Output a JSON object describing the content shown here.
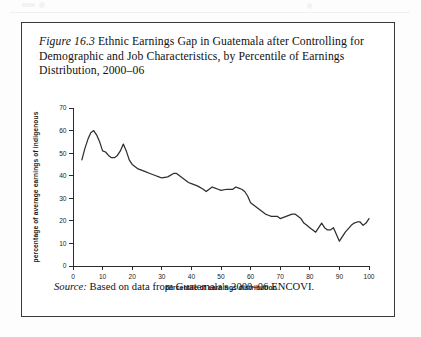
{
  "figure": {
    "label": "Figure 16.3",
    "title_rest": " Ethnic Earnings Gap in Guatemala after Controlling for Demographic and Job Characteristics, by Percentile of Earnings Distribution, 2000–06",
    "source_label": "Source:",
    "source_text": " Based on data from Guatemala's 2000–06 ENCOVI."
  },
  "chart_data": {
    "type": "line",
    "title": "",
    "xlabel": "percentile of earnings distribution",
    "ylabel": "percentage of average earnings of indigenous",
    "xlim": [
      0,
      100
    ],
    "ylim": [
      0,
      70
    ],
    "xticks": [
      0,
      10,
      20,
      30,
      40,
      50,
      60,
      70,
      80,
      90,
      100
    ],
    "yticks": [
      0,
      10,
      20,
      30,
      40,
      50,
      60,
      70
    ],
    "xtick_labels": [
      "0",
      "10",
      "20",
      "30",
      "40",
      "50",
      "60",
      "70",
      "80",
      "90",
      "100"
    ],
    "ytick_labels": [
      "0",
      "10",
      "20",
      "30",
      "40",
      "50",
      "60",
      "70"
    ],
    "grid": false,
    "legend": false,
    "line_color": "#2e2e2e",
    "series": [
      {
        "name": "ethnic earnings gap",
        "x": [
          3,
          4,
          5,
          6,
          7,
          8,
          9,
          10,
          11,
          12,
          13,
          14,
          15,
          16,
          17,
          18,
          19,
          20,
          22,
          24,
          26,
          28,
          29,
          30,
          32,
          34,
          35,
          36,
          37,
          38,
          39,
          40,
          42,
          44,
          45,
          46,
          47,
          48,
          49,
          50,
          52,
          54,
          55,
          56,
          57,
          58,
          59,
          60,
          62,
          64,
          65,
          66,
          67,
          68,
          69,
          70,
          72,
          74,
          75,
          76,
          77,
          78,
          79,
          80,
          81,
          82,
          83,
          84,
          85,
          86,
          87,
          88,
          89,
          90,
          92,
          94,
          95,
          96,
          97,
          98,
          99,
          100
        ],
        "y": [
          47,
          52,
          56,
          59,
          60,
          58,
          55,
          51,
          50.5,
          49,
          48,
          48,
          49,
          51,
          54,
          51,
          47,
          45,
          43,
          42,
          41,
          40,
          39.5,
          39,
          39.5,
          41,
          41,
          40,
          39,
          38,
          37,
          36.5,
          35.5,
          34,
          33,
          34,
          35,
          34.5,
          34,
          33.5,
          34,
          34,
          35,
          34.5,
          34,
          33,
          31,
          28,
          26,
          24,
          23,
          22.5,
          22,
          22,
          22,
          21,
          22,
          23,
          23,
          22,
          21,
          19,
          18,
          17,
          16,
          15,
          17,
          19,
          17,
          16,
          16,
          17,
          14,
          11,
          15,
          18,
          19,
          19.5,
          19.5,
          18,
          19,
          21
        ]
      }
    ]
  }
}
